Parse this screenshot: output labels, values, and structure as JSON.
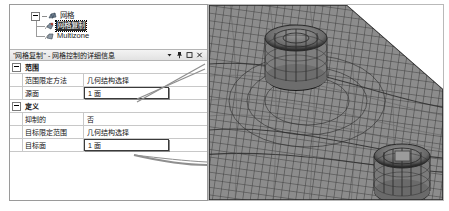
{
  "window": {
    "background_color": "#ffffff",
    "panel_border_color": "#9a9a9a"
  },
  "tree": {
    "items": [
      {
        "label": "网格",
        "icon": "mesh-icon",
        "level": 0,
        "expander": "minus",
        "selected": false
      },
      {
        "label": "网格复制",
        "icon": "mesh-copy-icon",
        "level": 1,
        "expander": "none",
        "selected": true
      },
      {
        "label": "Multizone",
        "icon": "multizone-icon",
        "level": 1,
        "expander": "none",
        "selected": false
      }
    ]
  },
  "details_panel": {
    "title": "\"网格复制\" - 网格控制的详细信息",
    "buttons": [
      {
        "name": "dropdown-button",
        "glyph": "▾"
      },
      {
        "name": "pin-button",
        "glyph": "pin"
      },
      {
        "name": "maximize-button",
        "glyph": "□"
      },
      {
        "name": "close-button",
        "glyph": "✕"
      }
    ],
    "groups": [
      {
        "name": "范围",
        "expander": "minus",
        "rows": [
          {
            "name": "范围限定方法",
            "value": "几何结构选择",
            "active": false
          },
          {
            "name": "源面",
            "value": "1 面",
            "active": true
          }
        ]
      },
      {
        "name": "定义",
        "expander": "minus",
        "rows": [
          {
            "name": "抑制的",
            "value": "否",
            "active": false
          },
          {
            "name": "目标限定范围",
            "value": "几何结构选择",
            "active": false
          },
          {
            "name": "目标面",
            "value": "1 面",
            "active": true
          }
        ]
      }
    ]
  },
  "callouts": [
    {
      "name": "source-face-leader",
      "from_row": "源面"
    },
    {
      "name": "target-face-leader",
      "from_row": "目标面"
    }
  ],
  "viewport": {
    "name": "mesh-viewport",
    "mesh_color": "#8d8d8d",
    "edge_color": "#3c3c3c",
    "background_color": "#ffffff",
    "features": [
      {
        "name": "source-face-hole",
        "description": "upper circular boss / hole"
      },
      {
        "name": "target-face-hole",
        "description": "lower-right circular boss / hole"
      },
      {
        "name": "chamfer-edge",
        "description": "diagonal corner cut at top right"
      }
    ]
  }
}
